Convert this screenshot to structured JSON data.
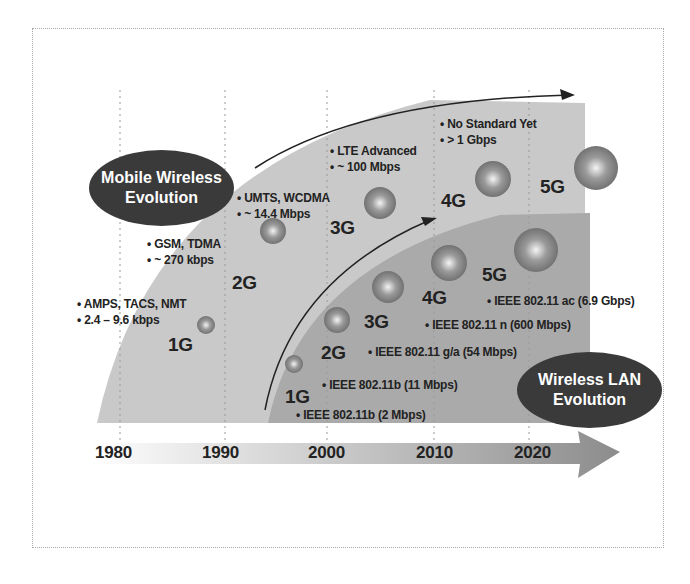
{
  "title_mobile": [
    "Mobile Wireless",
    "Evolution"
  ],
  "title_wlan": [
    "Wireless LAN",
    "Evolution"
  ],
  "timeline": {
    "years": [
      "1980",
      "1990",
      "2000",
      "2010",
      "2020"
    ]
  },
  "mobile": [
    {
      "gen": "1G",
      "bullets": [
        "• AMPS, TACS, NMT",
        "• 2.4 – 9.6 kbps"
      ]
    },
    {
      "gen": "2G",
      "bullets": [
        "• GSM, TDMA",
        "• ~ 270 kbps"
      ]
    },
    {
      "gen": "3G",
      "bullets": [
        "• UMTS, WCDMA",
        "• ~ 14.4 Mbps"
      ]
    },
    {
      "gen": "4G",
      "bullets": [
        "• LTE Advanced",
        "• ~ 100 Mbps"
      ]
    },
    {
      "gen": "5G",
      "bullets": [
        "• No Standard Yet",
        "• > 1 Gbps"
      ]
    }
  ],
  "wlan": [
    {
      "gen": "1G",
      "label": "• IEEE 802.11b (2 Mbps)"
    },
    {
      "gen": "2G",
      "label": "• IEEE 802.11b (11 Mbps)"
    },
    {
      "gen": "3G",
      "label": "• IEEE 802.11 g/a (54 Mbps)"
    },
    {
      "gen": "4G",
      "label": "• IEEE 802.11 n (600 Mbps)"
    },
    {
      "gen": "5G",
      "label": "• IEEE 802.11 ac (6.9 Gbps)"
    }
  ],
  "colors": {
    "outer_region": "#c8c8c8",
    "inner_region": "#a9a9a9",
    "oval": "#3a3a3a",
    "sphere": "#8a8a8a"
  }
}
